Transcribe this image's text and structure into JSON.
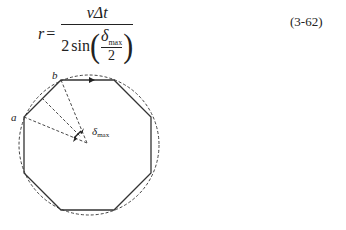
{
  "equation": {
    "lhs": "r",
    "equals": "=",
    "numerator": "vΔt",
    "denominator_coef": "2",
    "denominator_func": "sin",
    "inner_numerator": "δ",
    "inner_numerator_sub": "max",
    "inner_denominator": "2",
    "number": "(3-62)"
  },
  "figure": {
    "label_a": "a",
    "label_b": "b",
    "label_delta": "δ",
    "label_delta_sub": "max"
  }
}
